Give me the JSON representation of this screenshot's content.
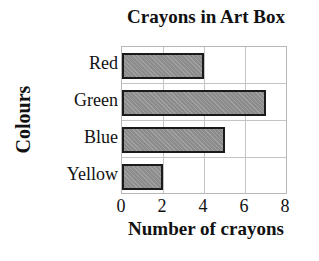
{
  "chart_data": {
    "type": "bar",
    "orientation": "horizontal",
    "title": "Crayons in Art Box",
    "xlabel": "Number of crayons",
    "ylabel": "Colours",
    "categories": [
      "Red",
      "Green",
      "Blue",
      "Yellow"
    ],
    "values": [
      4,
      7,
      5,
      2
    ],
    "xlim": [
      0,
      8
    ],
    "xticks": [
      "0",
      "2",
      "4",
      "6",
      "8"
    ],
    "grid": true,
    "legend": null,
    "bar_color": "#8c8c8c",
    "bar_edge_color": "#1a1a1a"
  }
}
